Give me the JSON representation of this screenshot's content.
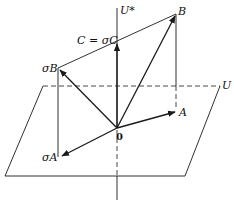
{
  "diagram": {
    "labels": {
      "u_star": "U*",
      "u": "U",
      "b": "B",
      "sigma_b": "σB",
      "c": "C = σC",
      "a": "A",
      "sigma_a": "σA",
      "origin": "0"
    },
    "points": {
      "origin": [
        117,
        128
      ],
      "B": [
        176,
        14
      ],
      "sigmaB": [
        58,
        68
      ],
      "A": [
        176,
        112
      ],
      "sigmaA": [
        60,
        157
      ],
      "C": [
        117,
        42
      ]
    },
    "plane": {
      "top_left": [
        43,
        86
      ],
      "top_right": [
        220,
        86
      ],
      "bottom_right": [
        185,
        176
      ],
      "bottom_left": [
        5,
        176
      ]
    },
    "colors": {
      "line": "#1a1a1a",
      "background": "#ffffff"
    }
  }
}
